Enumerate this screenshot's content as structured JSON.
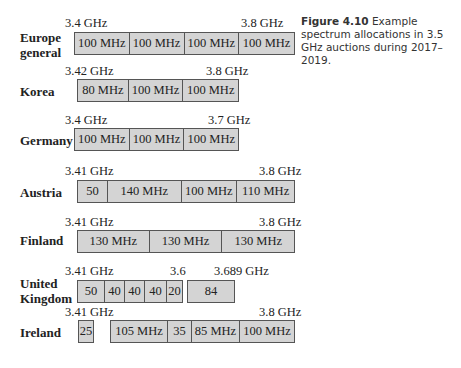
{
  "caption": {
    "label": "Figure 4.10",
    "text": " Example spectrum allocations in 3.5 GHz auctions during 2017–2019."
  },
  "rows": [
    {
      "country": "Europe general",
      "start": "3.4 GHz",
      "end": "3.8 GHz",
      "segments": [
        "100 MHz",
        "100 MHz",
        "100 MHz",
        "100 MHz"
      ]
    },
    {
      "country": "Korea",
      "start": "3.42 GHz",
      "end": "3.8 GHz",
      "segments": [
        "80 MHz",
        "100 MHz",
        "100 MHz"
      ]
    },
    {
      "country": "Germany",
      "start": "3.4 GHz",
      "end": "3.7 GHz",
      "segments": [
        "100 MHz",
        "100 MHz",
        "100 MHz"
      ]
    },
    {
      "country": "Austria",
      "start": "3.41 GHz",
      "end": "3.8 GHz",
      "segments": [
        "50",
        "140 MHz",
        "100 MHz",
        "110 MHz"
      ]
    },
    {
      "country": "Finland",
      "start": "3.41 GHz",
      "end": "3.8 GHz",
      "segments": [
        "130 MHz",
        "130 MHz",
        "130 MHz"
      ]
    },
    {
      "country": "United Kingdom",
      "start": "3.41 GHz",
      "mid": "3.6",
      "end": "3.689 GHz",
      "segments": [
        "50",
        "40",
        "40",
        "40",
        "20"
      ],
      "segments2": [
        "84"
      ]
    },
    {
      "country": "Ireland",
      "start": "3.41 GHz",
      "end": "3.8 GHz",
      "segments": [
        "25"
      ],
      "segments2": [
        "105 MHz",
        "35",
        "85 MHz",
        "100 MHz"
      ]
    }
  ]
}
